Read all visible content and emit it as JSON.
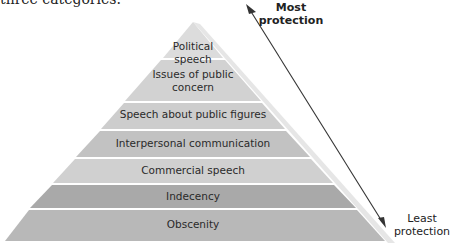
{
  "intro_text": "three categories.",
  "pyramid": {
    "layers": [
      {
        "line1": "Political",
        "line2": "speech",
        "color": "#dcdcdc"
      },
      {
        "line1": "Issues of public",
        "line2": "concern",
        "color": "#d2d2d2"
      },
      {
        "line1": "Speech about public figures",
        "line2": "",
        "color": "#cdcdcd"
      },
      {
        "line1": "Interpersonal communication",
        "line2": "",
        "color": "#c2c2c2"
      },
      {
        "line1": "Commercial speech",
        "line2": "",
        "color": "#d0d0d0"
      },
      {
        "line1": "Indecency",
        "line2": "",
        "color": "#a9a9a9"
      },
      {
        "line1": "Obscenity",
        "line2": "",
        "color": "#b8b8b8"
      }
    ]
  },
  "arrow": {
    "top_label_line1": "Most",
    "top_label_line2": "protection",
    "bottom_label_line1": "Least",
    "bottom_label_line2": "protection"
  }
}
